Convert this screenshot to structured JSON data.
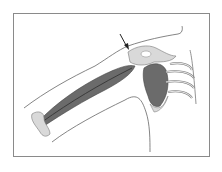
{
  "figure": {
    "annotation": "arrow pointing to shoulder joint",
    "colors": {
      "muscle": "#6b6b6b",
      "muscle_dark": "#3f3f3f",
      "bone": "#d9d9d9",
      "outline": "#555555",
      "frame": "#8a8a8a"
    }
  }
}
